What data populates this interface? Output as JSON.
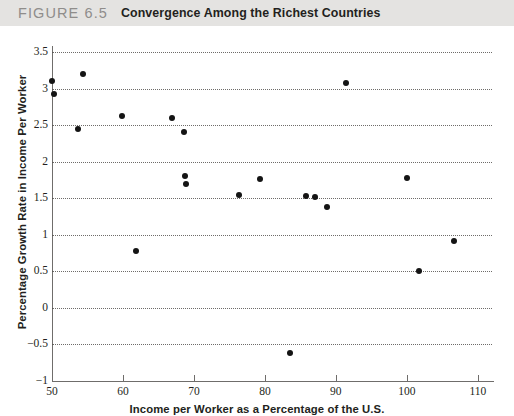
{
  "caption": {
    "figure_number": "FIGURE 6.5",
    "title": "Convergence Among the Richest Countries"
  },
  "chart_data": {
    "type": "scatter",
    "title": "Convergence Among the Richest Countries",
    "xlabel": "Income per Worker as a Percentage of the U.S.",
    "ylabel": "Percentage Growth Rate in Income Per Worker",
    "xlim": [
      50,
      112
    ],
    "ylim": [
      -1,
      3.5
    ],
    "xticks": [
      50,
      60,
      70,
      80,
      90,
      100,
      110
    ],
    "xtick_labels": [
      "50",
      "60",
      "70",
      "80",
      "90",
      "100",
      "110"
    ],
    "yticks": [
      -1,
      -0.5,
      0,
      0.5,
      1,
      1.5,
      2,
      2.5,
      3,
      3.5
    ],
    "ytick_labels": [
      "−1",
      "−0.5",
      "0",
      "0.5",
      "1",
      "1.5",
      "2",
      "2.5",
      "3",
      "3.5"
    ],
    "grid": "horizontal-dotted",
    "legend": "none",
    "marker": "filled-circle",
    "marker_color": "#141414",
    "points": [
      {
        "x": 50.0,
        "y": 3.1
      },
      {
        "x": 50.3,
        "y": 2.93
      },
      {
        "x": 54.3,
        "y": 3.2
      },
      {
        "x": 53.7,
        "y": 2.45
      },
      {
        "x": 59.9,
        "y": 2.62
      },
      {
        "x": 61.8,
        "y": 0.78
      },
      {
        "x": 66.9,
        "y": 2.6
      },
      {
        "x": 68.6,
        "y": 2.4
      },
      {
        "x": 68.7,
        "y": 1.8
      },
      {
        "x": 68.9,
        "y": 1.7
      },
      {
        "x": 76.4,
        "y": 1.55
      },
      {
        "x": 79.3,
        "y": 1.76
      },
      {
        "x": 83.6,
        "y": -0.62
      },
      {
        "x": 85.8,
        "y": 1.53
      },
      {
        "x": 87.0,
        "y": 1.52
      },
      {
        "x": 88.8,
        "y": 1.38
      },
      {
        "x": 91.4,
        "y": 3.07
      },
      {
        "x": 100.0,
        "y": 1.77
      },
      {
        "x": 101.7,
        "y": 0.5
      },
      {
        "x": 106.7,
        "y": 0.92
      }
    ]
  }
}
